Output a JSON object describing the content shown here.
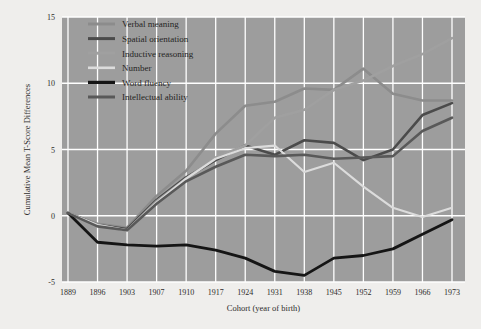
{
  "chart_data": {
    "type": "line",
    "title": "",
    "xlabel": "Cohort (year of birth)",
    "ylabel": "Cumulative Mean T-Score Differences",
    "categories": [
      "1889",
      "1896",
      "1903",
      "1907",
      "1910",
      "1917",
      "1924",
      "1931",
      "1938",
      "1945",
      "1952",
      "1959",
      "1966",
      "1973"
    ],
    "ylim": [
      -5,
      15
    ],
    "yticks": [
      "-5",
      "0",
      "5",
      "10",
      "15"
    ],
    "ytick_values": [
      -5,
      0,
      5,
      10,
      15
    ],
    "grid": true,
    "legend_position": "top-left",
    "plot_background": "#9d9d9d",
    "grid_color": "#ffffff",
    "figure_background": "#efeeec",
    "series": [
      {
        "name": "Verbal meaning",
        "color": "#8c8c8c",
        "width": 2.6,
        "values": [
          0.2,
          -0.6,
          -0.9,
          1.5,
          3.4,
          6.2,
          8.3,
          8.6,
          9.6,
          9.5,
          11.1,
          9.2,
          8.7,
          8.7
        ]
      },
      {
        "name": "Spatial orientation",
        "color": "#4b4b4b",
        "width": 2.6,
        "values": [
          0.2,
          -0.7,
          -1.0,
          1.2,
          2.9,
          4.2,
          5.3,
          4.6,
          5.7,
          5.5,
          4.2,
          5.0,
          7.6,
          8.5
        ]
      },
      {
        "name": "Inductive reasoning",
        "color": "#a0a0a0",
        "width": 2.6,
        "values": [
          0.2,
          -0.7,
          -1.1,
          1.1,
          2.8,
          4.4,
          5.3,
          7.4,
          8.0,
          9.5,
          10.2,
          11.3,
          12.2,
          13.4
        ]
      },
      {
        "name": "Number",
        "color": "#dcdcdc",
        "width": 2.2,
        "values": [
          0.2,
          -0.7,
          -1.1,
          1.0,
          2.8,
          4.3,
          5.1,
          5.3,
          3.3,
          4.0,
          2.2,
          0.6,
          -0.1,
          0.6
        ]
      },
      {
        "name": "Word fluency",
        "color": "#151515",
        "width": 2.8,
        "values": [
          0.2,
          -2.0,
          -2.2,
          -2.3,
          -2.2,
          -2.6,
          -3.2,
          -4.2,
          -4.5,
          -3.2,
          -3.0,
          -2.5,
          -1.4,
          -0.3
        ]
      },
      {
        "name": "Intellectual ability",
        "color": "#595959",
        "width": 2.6,
        "values": [
          0.2,
          -0.8,
          -1.1,
          0.9,
          2.6,
          3.7,
          4.6,
          4.5,
          4.6,
          4.3,
          4.4,
          4.5,
          6.4,
          7.4
        ]
      }
    ]
  }
}
